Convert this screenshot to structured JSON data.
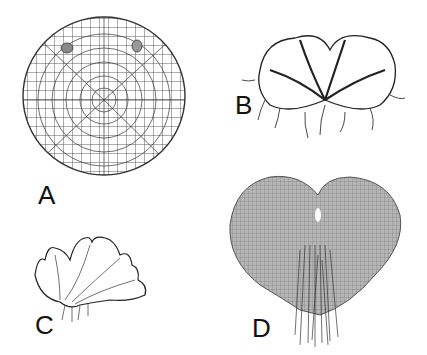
{
  "figure": {
    "panels": [
      {
        "id": "A",
        "label": "A",
        "description": "circular cellular disc with two oval structures near top"
      },
      {
        "id": "B",
        "label": "B",
        "description": "lobed thallus with dark midribs and rhizoids"
      },
      {
        "id": "C",
        "label": "C",
        "description": "ruffled lobed thallus with rhizoids below"
      },
      {
        "id": "D",
        "label": "D",
        "description": "heart-shaped cellular thallus with notch and rhizoid bundle"
      }
    ],
    "colors": {
      "ink": "#222222",
      "background": "#ffffff",
      "fill_D": "#9a9a9a"
    }
  }
}
